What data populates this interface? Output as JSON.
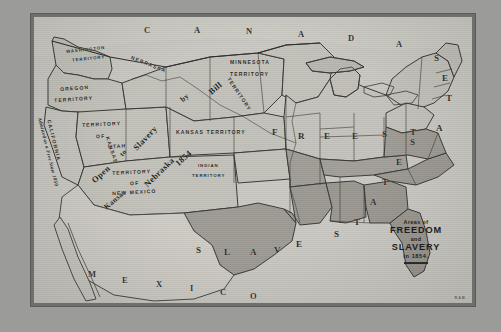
{
  "map": {
    "title_block": {
      "line1": "Areas of",
      "line2": "FREEDOM",
      "line3": "and",
      "line4": "SLAVERY",
      "line5": "in 1854."
    },
    "signature": "R.A.M.",
    "countries": [
      {
        "name": "canada",
        "letters": [
          "C",
          "A",
          "N",
          "A",
          "D",
          "A"
        ]
      },
      {
        "name": "mexico",
        "letters": [
          "M",
          "E",
          "X",
          "I",
          "C",
          "O"
        ]
      }
    ],
    "region_legends": [
      {
        "name": "free-states",
        "letters": [
          "F",
          "R",
          "E",
          "E",
          "S",
          "T",
          "A",
          "T",
          "E",
          "S"
        ]
      },
      {
        "name": "slave-states",
        "letters": [
          "S",
          "L",
          "A",
          "V",
          "E",
          "S",
          "T",
          "A",
          "T",
          "E",
          "S"
        ]
      }
    ],
    "territories": [
      {
        "name": "washington-territory",
        "line1": "WASHINGTON",
        "line2": "TERRITORY"
      },
      {
        "name": "oregon-territory",
        "line1": "OREGON",
        "line2": "TERRITORY"
      },
      {
        "name": "utah-territory",
        "line1": "TERRITORY",
        "line2": "OF",
        "line3": "UTAH"
      },
      {
        "name": "new-mexico-territory",
        "line1": "TERRITORY",
        "line2": "OF",
        "line3": "NEW MEXICO"
      },
      {
        "name": "nebraska-territory",
        "label": "NEBRASKA"
      },
      {
        "name": "nebraska-territory-word",
        "label": "TERRITORY"
      },
      {
        "name": "minnesota-territory",
        "line1": "MINNESOTA",
        "line2": "TERRITORY"
      },
      {
        "name": "kansas-territory",
        "label": "KANSAS TERRITORY"
      },
      {
        "name": "kansas-territory-vertical",
        "label": "KANSAS"
      },
      {
        "name": "indian-territory",
        "line1": "INDIAN",
        "line2": "TERRITORY"
      },
      {
        "name": "california",
        "label": "CALIFORNIA"
      }
    ],
    "annotations": [
      {
        "name": "california-note",
        "text": "Admitted as a Free State 1850"
      },
      {
        "name": "kansas-nebraska-bill-note",
        "words": [
          "Open",
          "to",
          "Slavery",
          "by",
          "Kansas",
          "Nebraska",
          "Bill",
          "1854"
        ],
        "text": "Open to Slavery by Kansas Nebraska Bill 1854"
      }
    ],
    "colors": {
      "paper": "#c9c7c0",
      "frame": "#6f6f6d",
      "free_fill": "#c3c1ba",
      "slave_fill": "#9d9b93",
      "outside_fill": "#d0cec7",
      "ink": "#2b2b2b"
    }
  }
}
